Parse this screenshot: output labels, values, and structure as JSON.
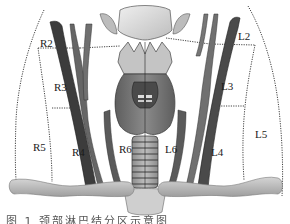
{
  "diagram": {
    "colors": {
      "background": "#ffffff",
      "vessel_dark": "#3a3a3a",
      "vessel_mid": "#6e6e6e",
      "cartilage": "#c8c8c8",
      "thyroid": "#7a7a7a",
      "trachea": "#9a9a9a",
      "clavicle": "#b4b4b4",
      "dotted_boundary": "#444444"
    },
    "regions_right": [
      {
        "id": "R2",
        "label": "R2"
      },
      {
        "id": "R3",
        "label": "R3"
      },
      {
        "id": "R4",
        "label": "R4"
      },
      {
        "id": "R5",
        "label": "R5"
      },
      {
        "id": "R6",
        "label": "R6"
      }
    ],
    "regions_left": [
      {
        "id": "L2",
        "label": "L2"
      },
      {
        "id": "L3",
        "label": "L3"
      },
      {
        "id": "L4",
        "label": "L4"
      },
      {
        "id": "L5",
        "label": "L5"
      },
      {
        "id": "L6",
        "label": "L6"
      }
    ]
  },
  "caption": {
    "text": "图 1 颈部淋巴结分区示意图"
  }
}
